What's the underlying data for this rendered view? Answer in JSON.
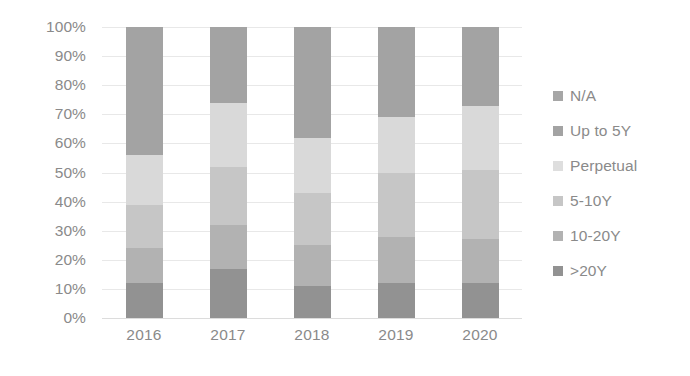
{
  "chart_data": {
    "type": "bar",
    "stacked": true,
    "stack_mode": "percent",
    "title": "",
    "xlabel": "",
    "ylabel": "",
    "ylim": [
      0,
      100
    ],
    "ytick_labels": [
      "100%",
      "90%",
      "80%",
      "70%",
      "60%",
      "50%",
      "40%",
      "30%",
      "20%",
      "10%",
      "0%"
    ],
    "ytick_values": [
      100,
      90,
      80,
      70,
      60,
      50,
      40,
      30,
      20,
      10,
      0
    ],
    "grid": true,
    "legend_position": "right",
    "categories": [
      "2016",
      "2017",
      "2018",
      "2019",
      "2020"
    ],
    "stack_order_bottom_to_top": [
      ">20Y",
      "10-20Y",
      "5-10Y",
      "Perpetual",
      "Up to 5Y",
      "N/A"
    ],
    "series": [
      {
        "name": "N/A",
        "color": "#a6a6a6",
        "values": [
          0,
          0,
          0,
          0,
          0
        ]
      },
      {
        "name": "Up to 5Y",
        "color": "#a3a3a3",
        "values": [
          44,
          26,
          38,
          31,
          27
        ]
      },
      {
        "name": "Perpetual",
        "color": "#d9d9d9",
        "values": [
          17,
          22,
          19,
          19,
          22
        ]
      },
      {
        "name": "5-10Y",
        "color": "#c6c6c6",
        "values": [
          15,
          20,
          18,
          22,
          24
        ]
      },
      {
        "name": "10-20Y",
        "color": "#b2b2b2",
        "values": [
          12,
          15,
          14,
          16,
          15
        ]
      },
      {
        "name": ">20Y",
        "color": "#929292",
        "values": [
          12,
          17,
          11,
          12,
          12
        ]
      }
    ]
  },
  "legend": {
    "items": [
      {
        "label": "N/A",
        "color": "#a6a6a6",
        "swatch": "legend-swatch-na"
      },
      {
        "label": "Up to 5Y",
        "color": "#a3a3a3",
        "swatch": "legend-swatch-up-to-5y"
      },
      {
        "label": "Perpetual",
        "color": "#dedede",
        "swatch": "legend-swatch-perpetual"
      },
      {
        "label": "5-10Y",
        "color": "#c6c6c6",
        "swatch": "legend-swatch-5-10y"
      },
      {
        "label": "10-20Y",
        "color": "#b2b2b2",
        "swatch": "legend-swatch-10-20y"
      },
      {
        "label": ">20Y",
        "color": "#929292",
        "swatch": "legend-swatch-gt-20y"
      }
    ]
  },
  "style": {
    "axis_text_color": "#8a8a8a",
    "gridline_color": "#e8e8e8",
    "background": "#ffffff"
  }
}
